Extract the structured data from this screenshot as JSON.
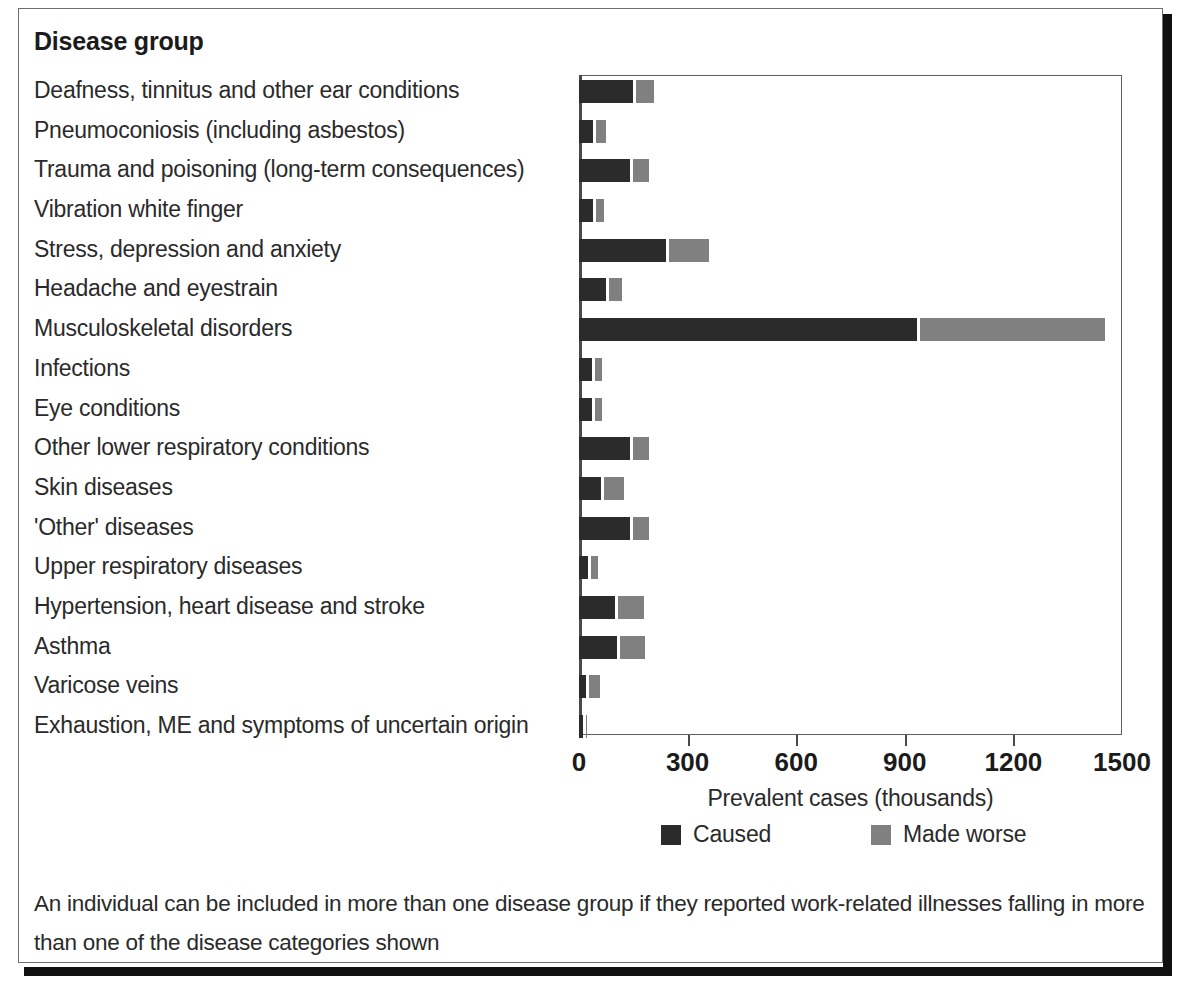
{
  "heading": "Disease group",
  "footnote": "An individual can be included in more than one disease group if they reported work-related illnesses falling in more than one of the disease categories shown",
  "legend": {
    "caused_label": "Caused",
    "worse_label": "Made worse",
    "caused_color": "#2b2b2b",
    "worse_color": "#808080"
  },
  "axis": {
    "title": "Prevalent cases (thousands)",
    "ticks": [
      "0",
      "300",
      "600",
      "900",
      "1200",
      "1500"
    ]
  },
  "chart_data": {
    "type": "bar",
    "orientation": "horizontal",
    "stacked": true,
    "title": "Disease group",
    "xlabel": "Prevalent cases (thousands)",
    "ylabel": "Disease group",
    "xlim": [
      0,
      1500
    ],
    "xticks": [
      0,
      300,
      600,
      900,
      1200,
      1500
    ],
    "grid": false,
    "legend_position": "bottom",
    "categories": [
      "Deafness, tinnitus and other ear conditions",
      "Pneumoconiosis (including asbestos)",
      "Trauma and poisoning (long-term consequences)",
      "Vibration white finger",
      "Stress, depression and anxiety",
      "Headache and eyestrain",
      "Musculoskeletal disorders",
      "Infections",
      "Eye conditions",
      "Other lower respiratory conditions",
      "Skin diseases",
      "'Other' diseases",
      "Upper respiratory diseases",
      "Hypertension, heart disease and stroke",
      "Asthma",
      "Varicose veins",
      "Exhaustion, ME and symptoms of uncertain origin"
    ],
    "series": [
      {
        "name": "Caused",
        "color": "#2b2b2b",
        "values": [
          150,
          40,
          140,
          40,
          240,
          75,
          935,
          35,
          35,
          140,
          60,
          140,
          25,
          100,
          105,
          20,
          10
        ]
      },
      {
        "name": "Made worse",
        "color": "#808080",
        "values": [
          50,
          25,
          45,
          20,
          110,
          35,
          510,
          20,
          20,
          45,
          55,
          45,
          20,
          70,
          70,
          30,
          5
        ]
      }
    ]
  }
}
